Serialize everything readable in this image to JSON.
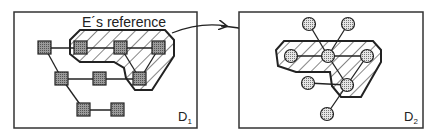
{
  "diagram": {
    "left_panel": {
      "label_main": "D",
      "label_sub": "1",
      "reference_label": "E´s reference",
      "node_shape": "square",
      "nodes": [
        {
          "id": "a",
          "x": 45,
          "y": 48
        },
        {
          "id": "b",
          "x": 81,
          "y": 48
        },
        {
          "id": "c",
          "x": 121,
          "y": 48
        },
        {
          "id": "d",
          "x": 159,
          "y": 48
        },
        {
          "id": "e",
          "x": 62,
          "y": 79
        },
        {
          "id": "f",
          "x": 100,
          "y": 79
        },
        {
          "id": "g",
          "x": 140,
          "y": 79
        },
        {
          "id": "h",
          "x": 84,
          "y": 110
        },
        {
          "id": "i",
          "x": 118,
          "y": 110
        }
      ]
    },
    "right_panel": {
      "label_main": "D",
      "label_sub": "2",
      "node_shape": "circle",
      "nodes": [
        {
          "id": "p",
          "x": 309,
          "y": 24
        },
        {
          "id": "q",
          "x": 348,
          "y": 24
        },
        {
          "id": "r",
          "x": 291,
          "y": 56
        },
        {
          "id": "s",
          "x": 328,
          "y": 56
        },
        {
          "id": "t",
          "x": 367,
          "y": 56
        },
        {
          "id": "u",
          "x": 308,
          "y": 83
        },
        {
          "id": "v",
          "x": 347,
          "y": 85
        },
        {
          "id": "w",
          "x": 327,
          "y": 114
        }
      ]
    },
    "arrow": {
      "from": "left_panel",
      "to": "right_panel",
      "style": "curved"
    }
  }
}
